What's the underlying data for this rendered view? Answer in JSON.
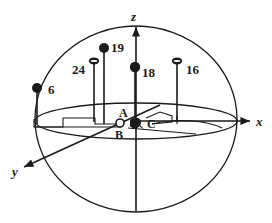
{
  "figure": {
    "background_color": "#ffffff",
    "stroke_color": "#1a1a1a"
  },
  "axes": [
    {
      "id": "z",
      "label": "z",
      "direction": "up",
      "arrow": true
    },
    {
      "id": "x",
      "label": "x",
      "direction": "right",
      "arrow": true
    },
    {
      "id": "y",
      "label": "y",
      "direction": "lower-left",
      "arrow": true
    }
  ],
  "nodes": [
    {
      "id": "A",
      "label": "A",
      "marker": "none"
    },
    {
      "id": "B",
      "label": "B",
      "marker": "hollow-circle"
    },
    {
      "id": "C",
      "label": "C",
      "marker": "filled-blob"
    }
  ],
  "stems": [
    {
      "label": "6",
      "marker": "filled-circle",
      "label_side": "right"
    },
    {
      "label": "24",
      "marker": "disc",
      "label_side": "left"
    },
    {
      "label": "19",
      "marker": "filled-circle",
      "label_side": "right"
    },
    {
      "label": "18",
      "marker": "filled-circle",
      "label_side": "right"
    },
    {
      "label": "16",
      "marker": "disc",
      "label_side": "right"
    }
  ]
}
